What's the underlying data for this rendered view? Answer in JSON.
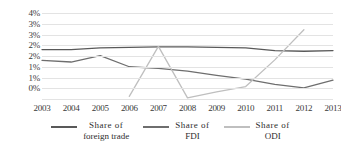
{
  "chart_data": {
    "type": "line",
    "title": "",
    "xlabel": "",
    "ylabel": "",
    "categories": [
      "2003",
      "2004",
      "2005",
      "2006",
      "2007",
      "2008",
      "2009",
      "2010",
      "2011",
      "2012",
      "2013"
    ],
    "ytick_labels": [
      "4%",
      "3%",
      "3%",
      "2%",
      "2%",
      "1%",
      "1%",
      "0%"
    ],
    "ytick_values": [
      4.0,
      3.5,
      3.0,
      2.5,
      2.0,
      1.5,
      1.0,
      0.5
    ],
    "ylim": [
      0,
      4
    ],
    "grid": true,
    "legend_position": "bottom",
    "series": [
      {
        "name": "Share of foreign trade",
        "name_line1": "Share of",
        "name_line2": "foreign trade",
        "color": "#595959",
        "values": [
          2.3,
          2.3,
          2.38,
          2.4,
          2.42,
          2.42,
          2.4,
          2.38,
          2.25,
          2.22,
          2.25
        ]
      },
      {
        "name": "Share of FDI",
        "name_line1": "Share  of",
        "name_line2": "FDI",
        "color": "#6e6e6e",
        "values": [
          1.8,
          1.72,
          2.02,
          1.5,
          1.42,
          1.3,
          1.1,
          0.92,
          0.68,
          0.52,
          0.88
        ]
      },
      {
        "name": "Share of ODI",
        "name_line1": "Share    of",
        "name_line2": "ODI",
        "color": "#bfbfbf",
        "values": [
          null,
          null,
          null,
          0.12,
          2.45,
          0.05,
          0.33,
          0.58,
          1.82,
          3.22,
          null
        ]
      }
    ]
  }
}
